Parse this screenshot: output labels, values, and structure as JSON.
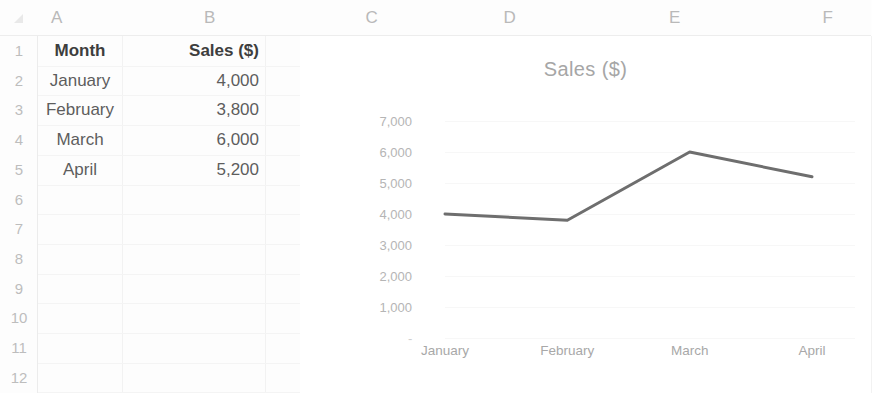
{
  "spreadsheet": {
    "column_headers": [
      "A",
      "B",
      "C",
      "D",
      "E",
      "F"
    ],
    "row_headers": [
      "1",
      "2",
      "3",
      "4",
      "5",
      "6",
      "7",
      "8",
      "9",
      "10",
      "11",
      "12"
    ],
    "table": {
      "header": [
        "Month",
        "Sales ($)"
      ],
      "rows": [
        [
          "January",
          "4,000"
        ],
        [
          "February",
          "3,800"
        ],
        [
          "March",
          "6,000"
        ],
        [
          "April",
          "5,200"
        ]
      ]
    }
  },
  "chart_data": {
    "type": "line",
    "title": "Sales ($)",
    "categories": [
      "January",
      "February",
      "March",
      "April"
    ],
    "values": [
      4000,
      3800,
      6000,
      5200
    ],
    "series": [
      {
        "name": "Sales ($)",
        "values": [
          4000,
          3800,
          6000,
          5200
        ]
      }
    ],
    "ytick_labels": [
      "7,000",
      "6,000",
      "5,000",
      "4,000",
      "3,000",
      "2,000",
      "1,000",
      "-"
    ],
    "ytick_values": [
      7000,
      6000,
      5000,
      4000,
      3000,
      2000,
      1000,
      0
    ],
    "ylim": [
      0,
      7000
    ],
    "xlabel": "",
    "ylabel": "",
    "grid": true,
    "legend": "none",
    "line_color": "#6e6e6e",
    "markers": false
  }
}
